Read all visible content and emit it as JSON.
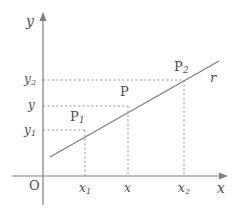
{
  "figure": {
    "width": 241,
    "height": 212,
    "background": "#ffffff",
    "stroke_color": "#808080",
    "guide_color": "#9a9a9a",
    "text_color": "#4d4d4d"
  },
  "axes": {
    "x": {
      "label": "x",
      "label_x": 219,
      "label_y": 183,
      "y_pos": 176,
      "start_x": 12,
      "end_x": 228,
      "arrow": "right-arrow-icon"
    },
    "y": {
      "label": "y",
      "label_x": 26,
      "label_y": 14,
      "x_pos": 43,
      "start_y": 205,
      "end_y": 12,
      "arrow": "up-arrow-icon"
    },
    "origin": {
      "label": "O",
      "label_x": 29,
      "label_y": 179
    }
  },
  "line": {
    "name": "r",
    "label": "r",
    "label_x": 209,
    "label_y": 71,
    "x1": 50,
    "y1": 157,
    "x2": 219,
    "y2": 61
  },
  "points": [
    {
      "id": "P1",
      "label": "P",
      "sub": "1",
      "px": 85,
      "py": 130,
      "label_x": 71,
      "label_y": 111,
      "x_tick": {
        "label": "x",
        "sub": "1",
        "x": 85,
        "label_x": 79,
        "label_y": 182
      },
      "y_tick": {
        "label": "y",
        "sub": "1",
        "y": 130,
        "label_x": 24,
        "label_y": 123
      }
    },
    {
      "id": "P",
      "label": "P",
      "sub": "",
      "px": 128,
      "py": 130,
      "label_x": 120,
      "label_y": 86,
      "x_tick": {
        "label": "x",
        "sub": "",
        "x": 128,
        "label_x": 124,
        "label_y": 182
      },
      "y_tick": {
        "label": "y",
        "sub": "",
        "y": 106,
        "label_x": 27,
        "label_y": 99
      }
    },
    {
      "id": "P2",
      "label": "P",
      "sub": "2",
      "px": 184,
      "py": 80,
      "label_x": 174,
      "label_y": 61,
      "x_tick": {
        "label": "x",
        "sub": "2",
        "x": 184,
        "label_x": 178,
        "label_y": 182
      },
      "y_tick": {
        "label": "y",
        "sub": "2",
        "y": 80,
        "label_x": 24,
        "label_y": 73
      }
    }
  ],
  "guides": {
    "vertical": [
      {
        "x": 85,
        "y_top": 130,
        "y_bottom": 176
      },
      {
        "x": 128,
        "y_top": 106,
        "y_bottom": 176
      },
      {
        "x": 184,
        "y_top": 80,
        "y_bottom": 176
      }
    ],
    "horizontal": [
      {
        "y": 130,
        "x_left": 43,
        "x_right": 85
      },
      {
        "y": 106,
        "x_left": 43,
        "x_right": 128
      },
      {
        "y": 80,
        "x_left": 43,
        "x_right": 184
      }
    ]
  }
}
